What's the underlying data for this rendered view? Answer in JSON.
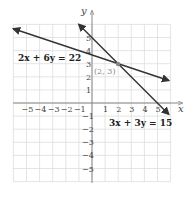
{
  "chart_data": {
    "type": "line",
    "title": "",
    "xlabel": "x",
    "ylabel": "y",
    "xlim": [
      -6,
      6
    ],
    "ylim": [
      -6,
      6
    ],
    "grid": true,
    "x_ticks": [
      "-5",
      "-4",
      "-3",
      "-2",
      "-1",
      "1",
      "2",
      "3",
      "4",
      "5"
    ],
    "y_ticks": [
      "5",
      "4",
      "3",
      "2",
      "1",
      "-1",
      "-2",
      "-3",
      "-4",
      "-5"
    ],
    "series": [
      {
        "name": "2x + 6y = 22",
        "equation": "2x + 6y = 22",
        "points": [
          [
            -6,
            5.67
          ],
          [
            5.85,
            1.72
          ]
        ],
        "color": "#333333"
      },
      {
        "name": "3x + 3y = 15",
        "equation": "3x + 3y = 15",
        "points": [
          [
            -1,
            6
          ],
          [
            5.85,
            -0.85
          ]
        ],
        "color": "#333333"
      }
    ],
    "annotations": [
      {
        "label": "(2, 3)",
        "x": 2,
        "y": 3,
        "type": "intersection-point",
        "color": "#888888"
      }
    ]
  },
  "labels": {
    "eq1": "2x + 6y = 22",
    "eq2": "3x + 3y = 15",
    "point": "(2, 3)",
    "x_axis": "x",
    "y_axis": "y"
  },
  "colors": {
    "grid": "#dddddd",
    "axis": "#888888",
    "line": "#333333",
    "point": "#888888"
  }
}
